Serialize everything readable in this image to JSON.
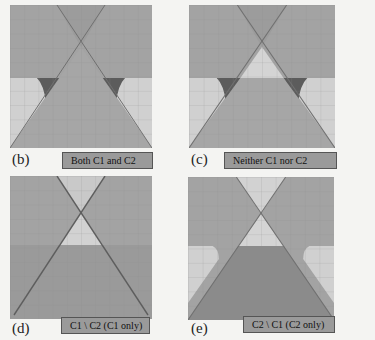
{
  "colors": {
    "mid_gray": "#a3a3a3",
    "light_gray": "#cfcfcf",
    "dark_gray": "#5a5a5a",
    "darker_gray": "#8c8c8c",
    "grid_line": "#8a8a8a",
    "boundary_line": "#6e6e6e"
  },
  "panels": [
    {
      "tag": "(b)",
      "caption": "Both C1 and C2"
    },
    {
      "tag": "(c)",
      "caption": "Neither C1 nor  C2"
    },
    {
      "tag": "(d)",
      "caption": "C1 \\ C2  (C1 only)"
    },
    {
      "tag": "(e)",
      "caption": "C2 \\ C1  (C2 only)"
    }
  ]
}
